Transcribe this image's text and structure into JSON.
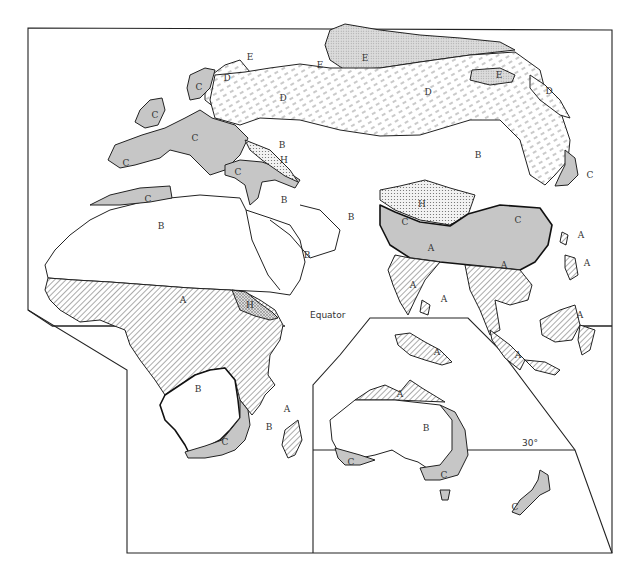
{
  "map": {
    "title": "Climate regions of the Eastern Hemisphere",
    "reference_lines": {
      "equator": "Equator",
      "lat_30": "30°"
    },
    "colors": {
      "A": "hatched-diagonal",
      "B": "#ffffff",
      "C": "#c6c6c6",
      "D": "dashed-light",
      "E": "#d2d2d2 dotted",
      "H": "stippled",
      "outline": "#222222"
    },
    "legend_codes": [
      "A",
      "B",
      "C",
      "D",
      "E",
      "H"
    ],
    "labels": {
      "europe_norway_c": "C",
      "scandinavia_d": "D",
      "scandinavia_e": "E",
      "british_isles_c": "C",
      "western_europe_c": "C",
      "iberia_c": "C",
      "north_africa_c": "C",
      "balkans_turkey_c": "C",
      "caucasus_h": "H",
      "russia_d": "D",
      "siberia_d": "D",
      "arctic_e": "E",
      "arctic_e2": "E",
      "east_siberia_e": "E",
      "kamchatka_d": "D",
      "japan_c": "C",
      "central_asia_b": "B",
      "mongolia_b": "B",
      "middle_east_b": "B",
      "iran_b": "B",
      "arabia_b": "B",
      "sahara_b": "B",
      "tibet_h": "H",
      "india_north_c": "C",
      "china_c": "C",
      "india_a": "A",
      "india_south_a": "A",
      "sri_lanka_a": "A",
      "southeast_asia_a": "A",
      "taiwan_a": "A",
      "philippines_a": "A",
      "borneo_a": "A",
      "indonesia_a": "A",
      "central_africa_a": "A",
      "ethiopia_h": "H",
      "southern_africa_b": "B",
      "south_africa_c": "C",
      "madagascar_a": "A",
      "madagascar_b": "B",
      "new_guinea_a": "A",
      "north_australia_a": "A",
      "australia_b": "B",
      "sw_australia_c": "C",
      "se_australia_c": "C",
      "new_zealand_c": "C"
    }
  }
}
